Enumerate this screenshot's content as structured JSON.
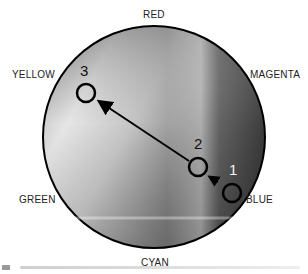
{
  "diagram": {
    "type": "color-wheel-path",
    "hue_labels": {
      "top": "RED",
      "upper_left": "YELLOW",
      "upper_right": "MAGENTA",
      "lower_left": "GREEN",
      "lower_right": "BLUE",
      "bottom": "CYAN"
    },
    "points": [
      {
        "label": "1",
        "x": 232,
        "y": 193
      },
      {
        "label": "2",
        "x": 198,
        "y": 167
      },
      {
        "label": "3",
        "x": 86,
        "y": 93
      }
    ],
    "arrows": [
      {
        "from": "1",
        "to": "2"
      },
      {
        "from": "2",
        "to": "3"
      }
    ],
    "wheel": {
      "cx": 154,
      "cy": 137,
      "r": 111,
      "stroke": "#000000"
    }
  }
}
